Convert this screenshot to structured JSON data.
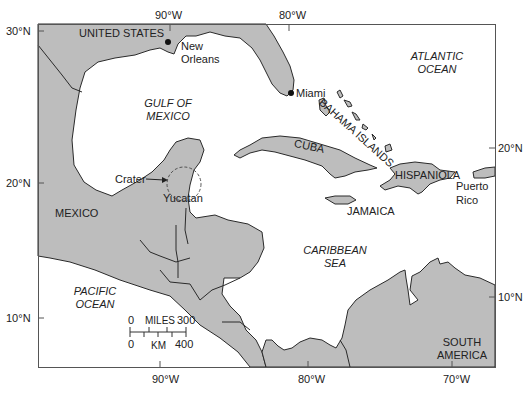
{
  "map": {
    "colors": {
      "land": "#bdbdbd",
      "water": "#ffffff",
      "border": "#2a2a2a",
      "frame": "#555555"
    },
    "axes": {
      "top": [
        "90°W",
        "80°W"
      ],
      "bottom": [
        "90°W",
        "80°W",
        "70°W"
      ],
      "left": [
        "30°N",
        "20°N",
        "10°N"
      ],
      "right": [
        "20°N",
        "10°N"
      ]
    },
    "countries": {
      "us": "UNITED STATES",
      "mexico": "MEXICO",
      "cuba": "CUBA",
      "jamaica": "JAMAICA",
      "hispaniola": "HISPANIOLA",
      "bahamas": "BAHAMA ISLANDS",
      "south_america_1": "SOUTH",
      "south_america_2": "AMERICA"
    },
    "water_bodies": {
      "gulf_1": "GULF OF",
      "gulf_2": "MEXICO",
      "atlantic_1": "ATLANTIC",
      "atlantic_2": "OCEAN",
      "caribbean_1": "CARIBBEAN",
      "caribbean_2": "SEA",
      "pacific_1": "PACIFIC",
      "pacific_2": "OCEAN"
    },
    "places": {
      "new_orleans_1": "New",
      "new_orleans_2": "Orleans",
      "miami": "Miami",
      "yucatan": "Yucatan",
      "puerto_rico_1": "Puerto",
      "puerto_rico_2": "Rico",
      "crater": "Crater"
    },
    "scale": {
      "miles_zero": "0",
      "miles_label": "MILES",
      "miles_max": "300",
      "km_zero": "0",
      "km_label": "KM",
      "km_max": "400"
    }
  }
}
